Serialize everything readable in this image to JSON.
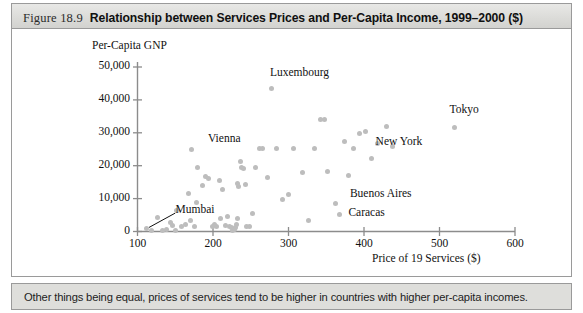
{
  "figure": {
    "number_label": "Figure 18.9",
    "title": "Relationship between Services Prices and Per-Capita Income, 1999–2000 ($)",
    "caption": "Other things being equal, prices of services tend to be higher in countries with higher per-capita incomes."
  },
  "colors": {
    "marker": "#bdbdbd",
    "axis": "#8c8c8c",
    "frame": "#9a9a9a",
    "titlebar": "#dcdcd9",
    "captionbar": "#dededb",
    "text": "#111111"
  },
  "chart_data": {
    "type": "scatter",
    "title": "Relationship between Services Prices and Per-Capita Income, 1999–2000 ($)",
    "xlabel": "Price of 19 Services ($)",
    "ylabel": "Per-Capita GNP",
    "xlim": [
      100,
      600
    ],
    "ylim": [
      0,
      50000
    ],
    "xticks": [
      100,
      200,
      300,
      400,
      500,
      600
    ],
    "xtick_labels": [
      "100",
      "200",
      "300",
      "400",
      "500",
      "600"
    ],
    "yticks": [
      0,
      10000,
      20000,
      30000,
      40000,
      50000
    ],
    "ytick_labels": [
      "0",
      "10,000",
      "20,000",
      "30,000",
      "40,000",
      "50,000"
    ],
    "grid": false,
    "legend": false,
    "series": [
      {
        "name": "Cities",
        "points": [
          [
            112,
            900
          ],
          [
            119,
            300
          ],
          [
            126,
            4200
          ],
          [
            133,
            300
          ],
          [
            138,
            700
          ],
          [
            144,
            2600
          ],
          [
            147,
            1900
          ],
          [
            150,
            300
          ],
          [
            152,
            6300
          ],
          [
            158,
            1600
          ],
          [
            163,
            2100
          ],
          [
            168,
            11500
          ],
          [
            170,
            3400
          ],
          [
            172,
            24900
          ],
          [
            176,
            1600
          ],
          [
            178,
            8800
          ],
          [
            180,
            19500
          ],
          [
            186,
            13900
          ],
          [
            190,
            16700
          ],
          [
            194,
            16200
          ],
          [
            199,
            1500
          ],
          [
            202,
            2100
          ],
          [
            205,
            1600
          ],
          [
            208,
            15500
          ],
          [
            210,
            3800
          ],
          [
            213,
            12800
          ],
          [
            216,
            1800
          ],
          [
            219,
            4500
          ],
          [
            222,
            1400
          ],
          [
            224,
            1300
          ],
          [
            226,
            200
          ],
          [
            228,
            600
          ],
          [
            230,
            1300
          ],
          [
            231,
            2200
          ],
          [
            232,
            3900
          ],
          [
            233,
            14600
          ],
          [
            234,
            13800
          ],
          [
            236,
            21300
          ],
          [
            238,
            19600
          ],
          [
            240,
            19300
          ],
          [
            243,
            14300
          ],
          [
            244,
            1500
          ],
          [
            248,
            1600
          ],
          [
            252,
            5400
          ],
          [
            256,
            19400
          ],
          [
            262,
            25300
          ],
          [
            266,
            25200
          ],
          [
            272,
            16300
          ],
          [
            278,
            43500
          ],
          [
            284,
            25300
          ],
          [
            292,
            9600
          ],
          [
            300,
            11300
          ],
          [
            306,
            25300
          ],
          [
            318,
            17900
          ],
          [
            326,
            3300
          ],
          [
            334,
            25300
          ],
          [
            342,
            34100
          ],
          [
            348,
            34100
          ],
          [
            352,
            18200
          ],
          [
            362,
            8600
          ],
          [
            368,
            5200
          ],
          [
            374,
            27400
          ],
          [
            380,
            17100
          ],
          [
            386,
            25100
          ],
          [
            394,
            29700
          ],
          [
            402,
            30500
          ],
          [
            410,
            22100
          ],
          [
            418,
            26700
          ],
          [
            430,
            31800
          ],
          [
            438,
            25800
          ],
          [
            520,
            31500
          ]
        ]
      }
    ],
    "annotations": [
      {
        "text": "Luxembourg",
        "x": 278,
        "y": 47800
      },
      {
        "text": "Vienna",
        "x": 196,
        "y": 27800
      },
      {
        "text": "Tokyo",
        "x": 516,
        "y": 36600
      },
      {
        "text": "New York",
        "x": 418,
        "y": 26900
      },
      {
        "text": "Buenos Aires",
        "x": 384,
        "y": 11000
      },
      {
        "text": "Caracas",
        "x": 382,
        "y": 5300
      },
      {
        "text": "Mumbai",
        "x": 153,
        "y": 6200
      }
    ],
    "leader_lines": [
      {
        "label": "Mumbai",
        "from_x": 150,
        "from_y": 5600,
        "to_x": 115,
        "to_y": 1200
      }
    ]
  }
}
